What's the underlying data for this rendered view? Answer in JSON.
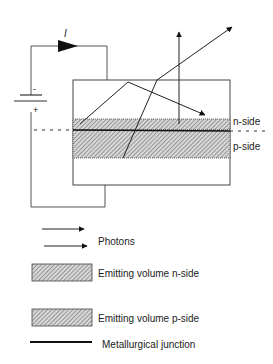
{
  "diagram": {
    "current_label": "I",
    "battery": {
      "minus": "-",
      "plus": "+"
    },
    "n_side_label": "n-side",
    "p_side_label": "p-side"
  },
  "legend": {
    "photons": "Photons",
    "emitting_n": "Emitting volume n-side",
    "emitting_p": "Emitting volume p-side",
    "junction": "Metallurgical junction"
  }
}
